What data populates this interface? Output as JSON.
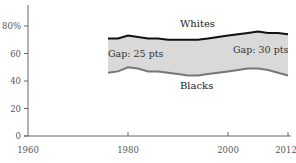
{
  "chart_data": {
    "type": "area",
    "title": "",
    "xlabel": "",
    "ylabel": "",
    "xlim": [
      1960,
      2012
    ],
    "ylim": [
      0,
      95
    ],
    "x_ticks": [
      1960,
      1980,
      2000,
      2012
    ],
    "x_tick_labels": [
      "1960",
      "1980",
      "2000",
      "2012"
    ],
    "y_ticks": [
      0,
      20,
      40,
      60,
      80
    ],
    "y_tick_labels": [
      "0",
      "20",
      "40",
      "60",
      "80%"
    ],
    "grid": false,
    "legend": "none (direct labels)",
    "x": [
      1976,
      1978,
      1980,
      1982,
      1984,
      1986,
      1988,
      1990,
      1992,
      1994,
      1996,
      1998,
      2000,
      2002,
      2004,
      2006,
      2008,
      2010,
      2012
    ],
    "series": [
      {
        "name": "Whites",
        "color": "#111111",
        "values": [
          71,
          71,
          73,
          72,
          71,
          71,
          70,
          70,
          70,
          70,
          71,
          72,
          73,
          74,
          75,
          76,
          75,
          75,
          74
        ]
      },
      {
        "name": "Blacks",
        "color": "#777777",
        "values": [
          46,
          47,
          50,
          49,
          47,
          47,
          46,
          45,
          44,
          44,
          45,
          46,
          47,
          48,
          49,
          49,
          48,
          46,
          44
        ]
      }
    ],
    "band_fill": "#d9d9d9",
    "annotations": [
      {
        "text": "Gap: 25 pts",
        "x": 1976,
        "y": 60
      },
      {
        "text": "Gap: 30 pts",
        "x": 2001,
        "y": 62
      },
      {
        "text": "Whites",
        "x": 1992,
        "y": 80
      },
      {
        "text": "Blacks",
        "x": 1991,
        "y": 36
      }
    ]
  },
  "labels": {
    "whites": "Whites",
    "blacks": "Blacks",
    "gap_left": "Gap: 25 pts",
    "gap_right": "Gap: 30 pts",
    "x_1960": "1960",
    "x_1980": "1980",
    "x_2000": "2000",
    "x_2012": "2012",
    "y_0": "0",
    "y_20": "20",
    "y_40": "40",
    "y_60": "60",
    "y_80": "80%"
  }
}
